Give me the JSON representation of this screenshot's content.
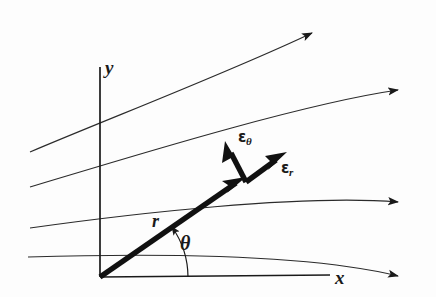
{
  "figure": {
    "background_color": "#fdfdfd",
    "stroke_color": "#1a1a1a",
    "labels": {
      "x_axis": "x",
      "y_axis": "y",
      "radius": "r",
      "angle": "θ",
      "unit_vector_theta": "ε",
      "unit_vector_theta_sub": "θ",
      "unit_vector_r": "ε",
      "unit_vector_r_sub": "r"
    },
    "elements": {
      "axes": {
        "y_axis_top": 67,
        "y_axis_bottom": 277,
        "y_axis_x": 100,
        "x_axis_left": 100,
        "x_axis_right": 330,
        "origin_x": 100,
        "origin_y": 277
      },
      "position_vector": {
        "from_x": 100,
        "from_y": 277,
        "to_x": 243,
        "to_y": 178,
        "style": "thick-arrow"
      },
      "angle_arc": {
        "radius": 88,
        "start_angle_deg": 0,
        "end_angle_deg": 35,
        "arrow_at": "end"
      },
      "unit_vectors": [
        {
          "name": "epsilon-r",
          "from_x": 248,
          "from_y": 180,
          "to_x": 283,
          "to_y": 155
        },
        {
          "name": "epsilon-theta",
          "from_x": 248,
          "from_y": 180,
          "to_x": 228,
          "to_y": 145
        }
      ],
      "streamlines": [
        {
          "index": 1,
          "start_x": 30,
          "start_y": 152,
          "end_x": 318,
          "end_y": 30,
          "curvature": "concave-down"
        },
        {
          "index": 2,
          "start_x": 30,
          "start_y": 187,
          "end_x": 404,
          "end_y": 89,
          "curvature": "concave-down"
        },
        {
          "index": 3,
          "start_x": 30,
          "start_y": 228,
          "end_x": 404,
          "end_y": 202,
          "curvature": "concave-down"
        },
        {
          "index": 4,
          "start_x": 28,
          "start_y": 257,
          "end_x": 404,
          "end_y": 277,
          "curvature": "concave-down"
        }
      ]
    }
  }
}
